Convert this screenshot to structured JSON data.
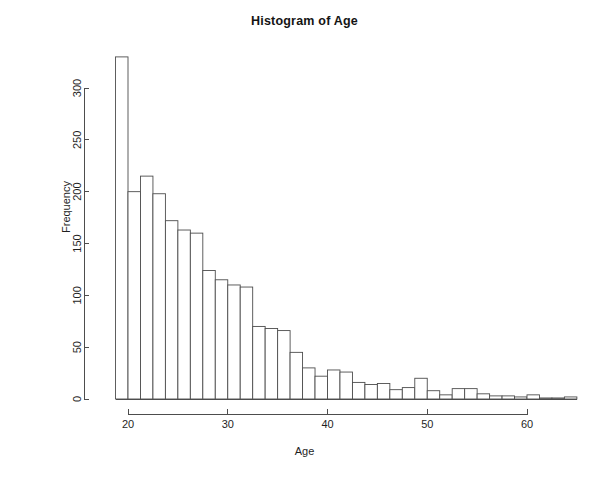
{
  "chart_data": {
    "type": "bar",
    "title": "Histogram of Age",
    "xlabel": "Age",
    "ylabel": "Frequency",
    "xlim": [
      18.4,
      65.2
    ],
    "ylim": [
      0,
      335
    ],
    "grid": false,
    "legend": null,
    "bin_width": 1.25,
    "x_ticks": [
      20,
      30,
      40,
      50,
      60
    ],
    "x_tick_labels": [
      "20",
      "30",
      "40",
      "50",
      "60"
    ],
    "y_ticks": [
      0,
      50,
      100,
      150,
      200,
      250,
      300
    ],
    "y_tick_labels": [
      "0",
      "50",
      "100",
      "150",
      "200",
      "250",
      "300"
    ],
    "bin_starts": [
      18.75,
      20.0,
      21.25,
      22.5,
      23.75,
      25.0,
      26.25,
      27.5,
      28.75,
      30.0,
      31.25,
      32.5,
      33.75,
      35.0,
      36.25,
      37.5,
      38.75,
      40.0,
      41.25,
      42.5,
      43.75,
      45.0,
      46.25,
      47.5,
      48.75,
      50.0,
      51.25,
      52.5,
      53.75,
      55.0,
      56.25,
      57.5,
      58.75,
      60.0,
      61.25,
      62.5,
      63.75
    ],
    "categories": [
      "18.75-20",
      "20-21.25",
      "21.25-22.5",
      "22.5-23.75",
      "23.75-25",
      "25-26.25",
      "26.25-27.5",
      "27.5-28.75",
      "28.75-30",
      "30-31.25",
      "31.25-32.5",
      "32.5-33.75",
      "33.75-35",
      "35-36.25",
      "36.25-37.5",
      "37.5-38.75",
      "38.75-40",
      "40-41.25",
      "41.25-42.5",
      "42.5-43.75",
      "43.75-45",
      "45-46.25",
      "46.25-47.5",
      "47.5-48.75",
      "48.75-50",
      "50-51.25",
      "51.25-52.5",
      "52.5-53.75",
      "53.75-55",
      "55-56.25",
      "56.25-57.5",
      "57.5-58.75",
      "58.75-60",
      "60-61.25",
      "61.25-62.5",
      "62.5-63.75",
      "63.75-65"
    ],
    "values": [
      330,
      200,
      215,
      198,
      172,
      163,
      160,
      124,
      115,
      110,
      108,
      70,
      68,
      66,
      45,
      30,
      22,
      28,
      26,
      16,
      14,
      15,
      9,
      11,
      20,
      8,
      4,
      10,
      10,
      5,
      3,
      3,
      2,
      4,
      1,
      1,
      2
    ],
    "series": [
      {
        "name": "Age frequency",
        "values": [
          330,
          200,
          215,
          198,
          172,
          163,
          160,
          124,
          115,
          110,
          108,
          70,
          68,
          66,
          45,
          30,
          22,
          28,
          26,
          16,
          14,
          15,
          9,
          11,
          20,
          8,
          4,
          10,
          10,
          5,
          3,
          3,
          2,
          4,
          1,
          1,
          2
        ]
      }
    ],
    "bar_fill": "#ffffff",
    "bar_stroke": "#4d4d4d",
    "axis_color": "#4d4d4d"
  }
}
